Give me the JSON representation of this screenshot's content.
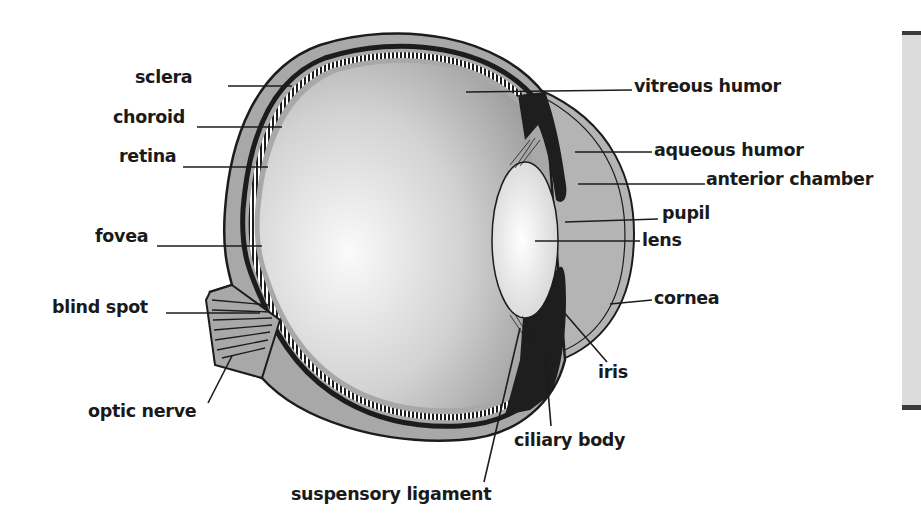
{
  "diagram": {
    "labels": [
      {
        "id": "sclera",
        "text": "sclera",
        "x": 135,
        "y": 67
      },
      {
        "id": "choroid",
        "text": "choroid",
        "x": 113,
        "y": 107
      },
      {
        "id": "retina",
        "text": "retina",
        "x": 119,
        "y": 146
      },
      {
        "id": "fovea",
        "text": "fovea",
        "x": 95,
        "y": 226
      },
      {
        "id": "blind-spot",
        "text": "blind spot",
        "x": 52,
        "y": 297
      },
      {
        "id": "optic-nerve",
        "text": "optic nerve",
        "x": 88,
        "y": 401
      },
      {
        "id": "vitreous-humor",
        "text": "vitreous humor",
        "x": 634,
        "y": 76
      },
      {
        "id": "aqueous-humor",
        "text": "aqueous humor",
        "x": 654,
        "y": 140
      },
      {
        "id": "anterior-chamber",
        "text": "anterior chamber",
        "x": 706,
        "y": 169
      },
      {
        "id": "pupil",
        "text": "pupil",
        "x": 662,
        "y": 203
      },
      {
        "id": "lens",
        "text": "lens",
        "x": 642,
        "y": 230
      },
      {
        "id": "cornea",
        "text": "cornea",
        "x": 654,
        "y": 288
      },
      {
        "id": "iris",
        "text": "iris",
        "x": 598,
        "y": 362
      },
      {
        "id": "ciliary-body",
        "text": "ciliary body",
        "x": 514,
        "y": 430
      },
      {
        "id": "suspensory-ligament",
        "text": "suspensory ligament",
        "x": 291,
        "y": 484
      }
    ],
    "colors": {
      "outer_layer": "#a8a8a8",
      "outline": "#1c1c1c",
      "vitreous_light": "#f4f4f4",
      "vitreous_dark": "#9a9a9a",
      "anterior": "#b4b4b4",
      "lens": "#f0f0f0",
      "iris_ciliary": "#1e1e1e",
      "label_text": "#1a1a1a",
      "side_panel": "#dcdcdc"
    }
  }
}
